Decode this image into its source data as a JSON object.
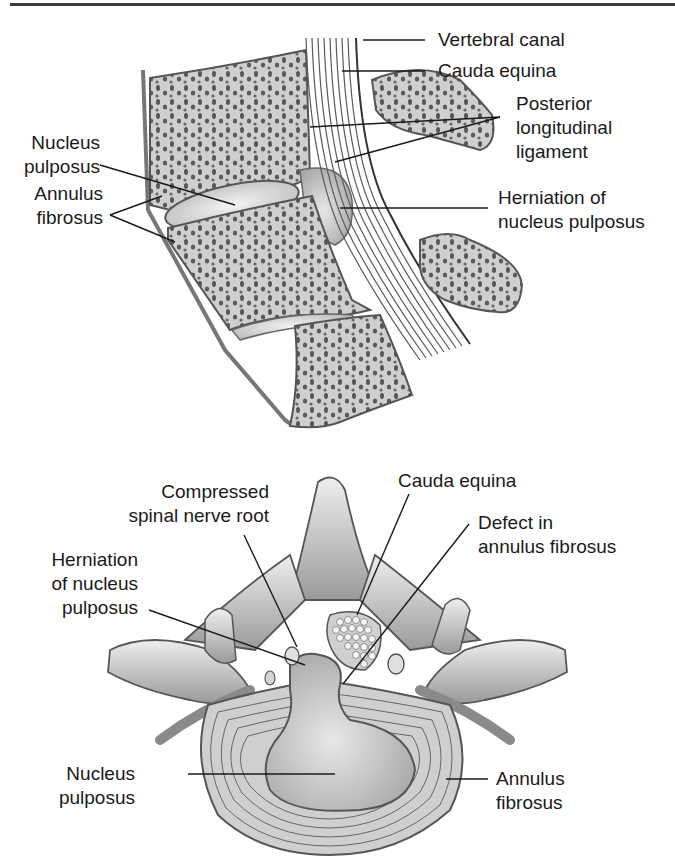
{
  "figure": {
    "top_panel": {
      "view": "sagittal",
      "labels": {
        "vertebral_canal": "Vertebral canal",
        "cauda_equina": "Cauda equina",
        "posterior_longitudinal_ligament": [
          "Posterior",
          "longitudinal",
          "ligament"
        ],
        "nucleus_pulposus": [
          "Nucleus",
          "pulposus"
        ],
        "herniation": [
          "Herniation of",
          "nucleus pulposus"
        ],
        "annulus_fibrosus": [
          "Annulus",
          "fibrosus"
        ]
      }
    },
    "bottom_panel": {
      "view": "axial",
      "labels": {
        "compressed_root": [
          "Compressed",
          "spinal nerve root"
        ],
        "cauda_equina": "Cauda equina",
        "defect": [
          "Defect in",
          "annulus fibrosus"
        ],
        "herniation": [
          "Herniation",
          "of nucleus",
          "pulposus"
        ],
        "nucleus_pulposus": [
          "Nucleus",
          "pulposus"
        ],
        "annulus_fibrosus": [
          "Annulus",
          "fibrosus"
        ]
      }
    },
    "colors": {
      "ink": "#1a1a1a",
      "bone_fill": "#d9d9d9",
      "bone_dark": "#4a4a4a",
      "disc_fill": "#e6e6e6",
      "rule": "#3a3a3a"
    }
  }
}
